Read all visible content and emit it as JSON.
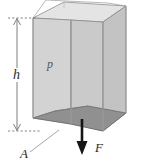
{
  "figure": {
    "type": "physics-diagram",
    "labels": {
      "height": "h",
      "pressure": "p",
      "area": "A",
      "force": "F"
    },
    "annotations": {
      "height_dimension": "h",
      "pressure_region": "p",
      "base_area_leader": "A",
      "force_arrow": "F"
    },
    "colors": {
      "front_face": "#cfd0cf",
      "right_face": "#c3c4c3",
      "top_face": "#e3e3e3",
      "bottom_face": "#8d8e8d",
      "outline": "#7a7a7a",
      "arrow": "#1a1a1a",
      "dimension_line": "#6f6f6f",
      "leader_line": "#8a8a8a",
      "background": "#ffffff",
      "label_text": "#2b2b2b"
    },
    "geometry": {
      "shape": "rectangular-prism",
      "view": "oblique-3d",
      "top_clipped": true
    }
  }
}
